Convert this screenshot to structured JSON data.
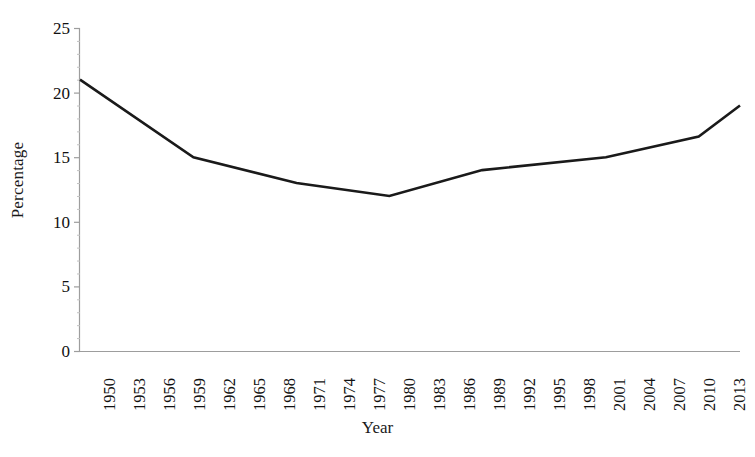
{
  "chart_data": {
    "type": "line",
    "title": "",
    "subtitle": "",
    "xlabel": "Year",
    "ylabel": "Percentage",
    "grid": false,
    "legend": false,
    "legend_position": "none",
    "line_color": "#1a1a1a",
    "background_color": "#ffffff",
    "axis_color": "#9a9a9a",
    "xlim": [
      1950,
      2014
    ],
    "ylim": [
      0,
      25
    ],
    "ytick_labels": [
      "25",
      "20",
      "15",
      "10",
      "5",
      "0"
    ],
    "ytick_values": [
      25,
      20,
      15,
      10,
      5,
      0
    ],
    "xtick_labels": [
      "1950",
      "1953",
      "1956",
      "1959",
      "1962",
      "1965",
      "1968",
      "1971",
      "1974",
      "1977",
      "1980",
      "1983",
      "1986",
      "1989",
      "1992",
      "1995",
      "1998",
      "2001",
      "2004",
      "2007",
      "2010",
      "2013"
    ],
    "xtick_values": [
      1950,
      1953,
      1956,
      1959,
      1962,
      1965,
      1968,
      1971,
      1974,
      1977,
      1980,
      1983,
      1986,
      1989,
      1992,
      1995,
      1998,
      2001,
      2004,
      2007,
      2010,
      2013
    ],
    "x": [
      1950,
      1961,
      1971,
      1980,
      1989,
      2001,
      2010,
      2014
    ],
    "values": [
      21.0,
      15.0,
      13.0,
      12.0,
      14.0,
      15.0,
      16.6,
      19.0
    ],
    "series": [
      {
        "name": "Percentage",
        "x": [
          1950,
          1961,
          1971,
          1980,
          1989,
          2001,
          2010,
          2014
        ],
        "values": [
          21.0,
          15.0,
          13.0,
          12.0,
          14.0,
          15.0,
          16.6,
          19.0
        ]
      }
    ],
    "annotations": []
  }
}
